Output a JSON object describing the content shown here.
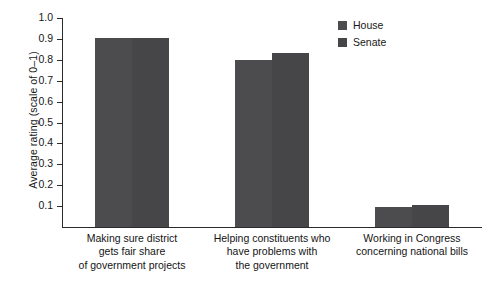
{
  "chart_data": {
    "type": "bar",
    "title": "",
    "xlabel": "",
    "ylabel": "Average rating (scale of 0–1)",
    "ylim": [
      0,
      1.0
    ],
    "yticks": [
      0.1,
      0.2,
      0.3,
      0.4,
      0.5,
      0.6,
      0.7,
      0.8,
      0.9,
      1.0
    ],
    "ytick_labels": [
      "0.1",
      "0.2",
      "0.3",
      "0.4",
      "0.5",
      "0.6",
      "0.7",
      "0.8",
      "0.9",
      "1.0"
    ],
    "grid": false,
    "legend_position": "top-right",
    "categories": [
      "Making sure district gets fair share of government projects",
      "Helping constituents who have problems with the government",
      "Working in Congress concerning national bills"
    ],
    "category_lines": [
      [
        "Making sure district",
        "gets fair share",
        "of government projects"
      ],
      [
        "Helping constituents who",
        "have problems with",
        "the government"
      ],
      [
        "Working in Congress",
        "concerning national bills"
      ]
    ],
    "series": [
      {
        "name": "House",
        "color": "#4c4c4f",
        "values": [
          0.905,
          0.8,
          0.095
        ]
      },
      {
        "name": "Senate",
        "color": "#464649",
        "values": [
          0.905,
          0.835,
          0.105
        ]
      }
    ]
  },
  "legend": {
    "items": [
      {
        "label": "House"
      },
      {
        "label": "Senate"
      }
    ]
  }
}
